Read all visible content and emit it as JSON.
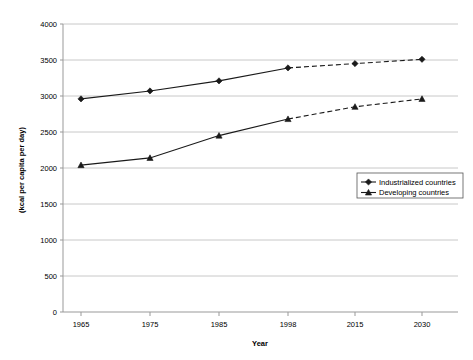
{
  "chart_data": {
    "type": "line",
    "title": "",
    "xlabel": "Year",
    "ylabel": "(kcal per capita per day)",
    "categories": [
      "1965",
      "1975",
      "1985",
      "1998",
      "2015",
      "2030"
    ],
    "x_tick_labels": [
      "1965",
      "1975",
      "1985",
      "1998",
      "2015",
      "2030"
    ],
    "y_tick_labels": [
      "0",
      "500",
      "1000",
      "1500",
      "2000",
      "2500",
      "3000",
      "3500",
      "4000"
    ],
    "ylim": [
      0,
      4000
    ],
    "y_step": 500,
    "grid": true,
    "legend_position": "center-right",
    "projection_starts_at": "1998",
    "series": [
      {
        "name": "Industrialized countries",
        "marker": "diamond",
        "color": "#000000",
        "values": [
          2960,
          3070,
          3210,
          3390,
          3450,
          3510
        ]
      },
      {
        "name": "Developing countries",
        "marker": "triangle",
        "color": "#000000",
        "values": [
          2040,
          2140,
          2450,
          2680,
          2850,
          2960
        ]
      }
    ]
  },
  "legend": {
    "entries": [
      {
        "label": "Industrialized countries",
        "marker": "diamond"
      },
      {
        "label": "Developing countries",
        "marker": "triangle"
      }
    ]
  },
  "colors": {
    "line": "#1a1a1a",
    "grid": "#c8c8c8",
    "axis": "#808080",
    "text": "#000000",
    "background": "#ffffff"
  }
}
